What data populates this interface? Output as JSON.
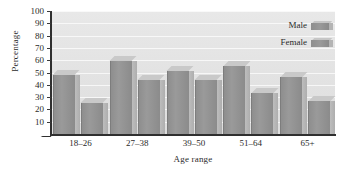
{
  "chart_data": {
    "type": "bar",
    "title": "",
    "xlabel": "Age range",
    "ylabel": "Percentage",
    "categories": [
      "18–26",
      "27–38",
      "39–50",
      "51–64",
      "65+"
    ],
    "series": [
      {
        "name": "Male",
        "values": [
          48,
          59,
          51,
          55,
          46
        ]
      },
      {
        "name": "Female",
        "values": [
          25,
          44,
          44,
          33,
          27
        ]
      }
    ],
    "ylim": [
      0,
      100
    ],
    "y_ticks": [
      10,
      20,
      30,
      40,
      50,
      60,
      70,
      80,
      90,
      100
    ],
    "grid": true,
    "legend_position": "top-right",
    "legend_entries": [
      "Male",
      "Female"
    ],
    "style": "3d-bar",
    "colors": {
      "bar_face": "#929292",
      "bar_side": "#b4b4b4",
      "bar_top": "#c9c9c9",
      "plot_background": "#e4e4e4",
      "gridline": "#ffffff",
      "axis": "#2f2f2f",
      "text": "#2b2b2b"
    }
  }
}
